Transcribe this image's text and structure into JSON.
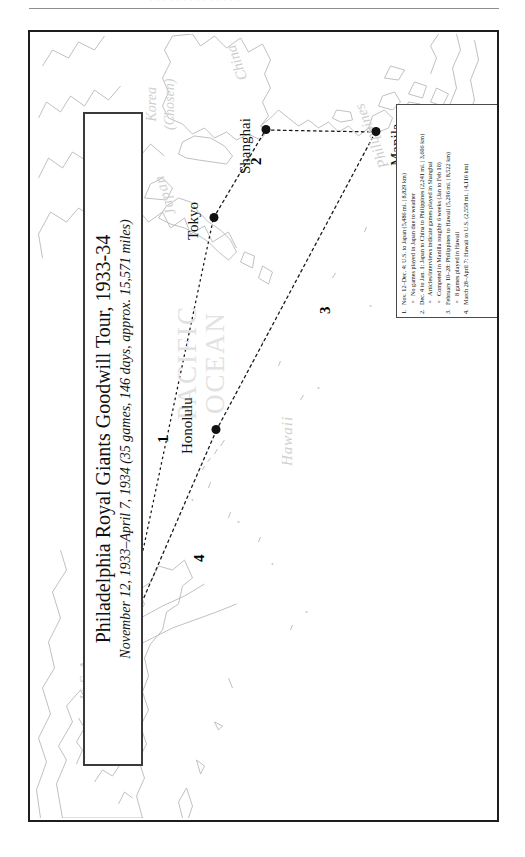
{
  "page": {
    "header_ghost_text": "· · · · · · · · · · · · · ·"
  },
  "title_box": {
    "main": "Philadelphia Royal Giants Goodwill Tour, 1933-34",
    "subtitle": "November 12, 1933–April 7, 1934 (35 games, 146 days, approx. 15,571 miles)"
  },
  "legend": {
    "items": [
      {
        "marker": "1.",
        "text": "Nov. 12–Dec. 4: U.S. to Japan (5,486 mi. | 8,829 km)",
        "subs": [
          {
            "bullet": "o",
            "text": "No games played in Japan due to weather"
          }
        ]
      },
      {
        "marker": "2.",
        "text": "Dec. 4 to Jan. 1: Japan to China to Philippines (2,241 mi. | 3,606 km)",
        "subs": [
          {
            "bullet": "o",
            "text": "Articles/interviews indicate games played in Shanghai"
          },
          {
            "bullet": "o",
            "text": "Competed in Manilla roughly 6 weeks (Jan to Feb 10)"
          }
        ]
      },
      {
        "marker": "3.",
        "text": "February 10–28: Philippines to Hawaii (5,296 mi. | 8,522 km)",
        "subs": [
          {
            "bullet": "o",
            "text": "8 games played in Hawaii"
          }
        ]
      },
      {
        "marker": "4.",
        "text": "March 28–April 7: Hawaii to U.S. (2,558 mi. | 4,116 km)",
        "subs": []
      }
    ]
  },
  "map": {
    "ocean_label_line1": "PACIFIC",
    "ocean_label_line2": "OCEAN",
    "regions": {
      "usa": "U.S.A.",
      "hawaii": "Hawaii",
      "japan": "Japan",
      "korea_line1": "Korea",
      "korea_line2": "(Chosen)",
      "china": "China",
      "philippines": "Philippines"
    },
    "cities": [
      {
        "name": "Los Angeles"
      },
      {
        "name": "Honolulu"
      },
      {
        "name": "Tokyo"
      },
      {
        "name": "Shanghai"
      },
      {
        "name": "Manila"
      }
    ],
    "route_numbers": [
      "1",
      "2",
      "3",
      "4"
    ]
  }
}
